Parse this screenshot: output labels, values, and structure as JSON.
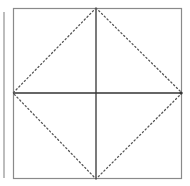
{
  "diagram": {
    "type": "square-with-inscribed-diamond",
    "square": {
      "x": 13,
      "y": 8,
      "width": 169,
      "height": 171,
      "stroke": "#8a8a8a"
    },
    "midlines": {
      "vertical_x": 96,
      "horizontal_y": 93,
      "stroke": "#333333"
    },
    "diamond": {
      "stroke": "#555555",
      "style": "dotted",
      "points": [
        [
          96,
          8
        ],
        [
          182,
          93
        ],
        [
          96,
          179
        ],
        [
          13,
          93
        ]
      ]
    },
    "left_bar_color": "#bdbdbd"
  }
}
